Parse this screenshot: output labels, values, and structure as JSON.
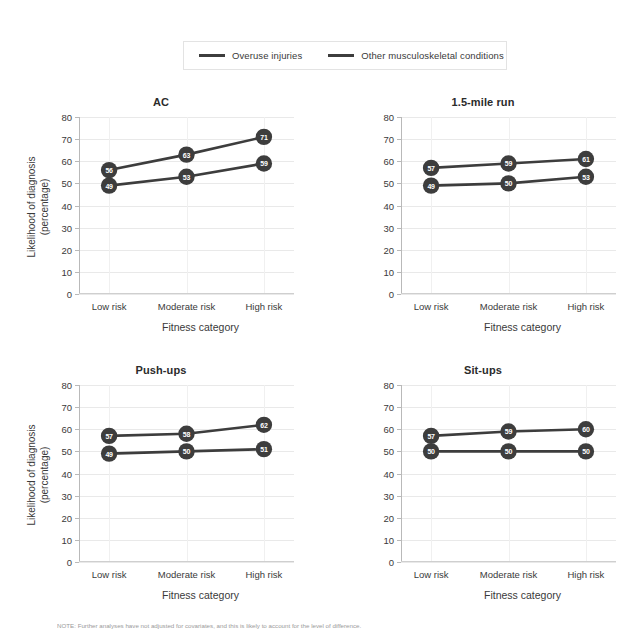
{
  "legend": {
    "entries": [
      {
        "label": "Overuse injuries",
        "color": "#3d3d3d"
      },
      {
        "label": "Other musculoskeletal conditions",
        "color": "#3d3d3d"
      }
    ]
  },
  "axis": {
    "y_title_line1": "Likelihood of diagnosis",
    "y_title_line2": "(percentage)",
    "x_title": "Fitness category",
    "y_ticks": [
      "80",
      "70",
      "60",
      "50",
      "40",
      "30",
      "20",
      "10",
      "0"
    ],
    "x_ticks": [
      "Low risk",
      "Moderate risk",
      "High risk"
    ]
  },
  "footnote": {
    "text": "NOTE: Further analyses have not adjusted for covariates, and this is likely to account for the level of difference."
  },
  "chart_data": [
    {
      "type": "line",
      "title": "AC",
      "categories": [
        "Low risk",
        "Moderate risk",
        "High risk"
      ],
      "xlabel": "Fitness category",
      "ylabel": "Likelihood of diagnosis (percentage)",
      "ylim": [
        0,
        80
      ],
      "grid": true,
      "legend_position": "top",
      "series": [
        {
          "name": "Overuse injuries",
          "values": [
            56,
            63,
            71
          ],
          "color": "#3d3d3d"
        },
        {
          "name": "Other musculoskeletal conditions",
          "values": [
            49,
            53,
            59
          ],
          "color": "#3d3d3d"
        }
      ]
    },
    {
      "type": "line",
      "title": "1.5-mile run",
      "categories": [
        "Low risk",
        "Moderate risk",
        "High risk"
      ],
      "xlabel": "Fitness category",
      "ylabel": "Likelihood of diagnosis (percentage)",
      "ylim": [
        0,
        80
      ],
      "grid": true,
      "legend_position": "top",
      "series": [
        {
          "name": "Overuse injuries",
          "values": [
            57,
            59,
            61
          ],
          "color": "#3d3d3d"
        },
        {
          "name": "Other musculoskeletal conditions",
          "values": [
            49,
            50,
            53
          ],
          "color": "#3d3d3d"
        }
      ]
    },
    {
      "type": "line",
      "title": "Push-ups",
      "categories": [
        "Low risk",
        "Moderate risk",
        "High risk"
      ],
      "xlabel": "Fitness category",
      "ylabel": "Likelihood of diagnosis (percentage)",
      "ylim": [
        0,
        80
      ],
      "grid": true,
      "legend_position": "top",
      "series": [
        {
          "name": "Overuse injuries",
          "values": [
            57,
            58,
            62
          ],
          "color": "#3d3d3d"
        },
        {
          "name": "Other musculoskeletal conditions",
          "values": [
            49,
            50,
            51
          ],
          "color": "#3d3d3d"
        }
      ]
    },
    {
      "type": "line",
      "title": "Sit-ups",
      "categories": [
        "Low risk",
        "Moderate risk",
        "High risk"
      ],
      "xlabel": "Fitness category",
      "ylabel": "Likelihood of diagnosis (percentage)",
      "ylim": [
        0,
        80
      ],
      "grid": true,
      "legend_position": "top",
      "series": [
        {
          "name": "Overuse injuries",
          "values": [
            57,
            59,
            60
          ],
          "color": "#3d3d3d"
        },
        {
          "name": "Other musculoskeletal conditions",
          "values": [
            50,
            50,
            50
          ],
          "color": "#3d3d3d"
        }
      ]
    }
  ]
}
